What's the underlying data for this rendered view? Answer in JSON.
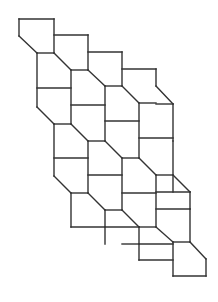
{
  "diagram": {
    "stroke_color": "#333333",
    "background": "#ffffff",
    "segments": [
      [
        19,
        19,
        54,
        19
      ],
      [
        19,
        19,
        19,
        36
      ],
      [
        19,
        36,
        37,
        53
      ],
      [
        54,
        19,
        54,
        53
      ],
      [
        37,
        53,
        54,
        53
      ],
      [
        54,
        35,
        88,
        35
      ],
      [
        88,
        35,
        88,
        70
      ],
      [
        54,
        53,
        71,
        70
      ],
      [
        71,
        70,
        88,
        70
      ],
      [
        88,
        52,
        122,
        52
      ],
      [
        122,
        52,
        122,
        86
      ],
      [
        88,
        70,
        105,
        86
      ],
      [
        105,
        86,
        122,
        86
      ],
      [
        122,
        69,
        156,
        69
      ],
      [
        156,
        69,
        156,
        86
      ],
      [
        156,
        86,
        173,
        104
      ],
      [
        37,
        53,
        37,
        107
      ],
      [
        37,
        88,
        71,
        88
      ],
      [
        71,
        70,
        71,
        124
      ],
      [
        71,
        105,
        105,
        105
      ],
      [
        105,
        86,
        105,
        141
      ],
      [
        105,
        121,
        139,
        121
      ],
      [
        122,
        86,
        139,
        103
      ],
      [
        139,
        103,
        156,
        103
      ],
      [
        139,
        103,
        139,
        158
      ],
      [
        156,
        104,
        173,
        104
      ],
      [
        173,
        104,
        173,
        141
      ],
      [
        139,
        138,
        173,
        138
      ],
      [
        37,
        107,
        54,
        124
      ],
      [
        54,
        124,
        71,
        124
      ],
      [
        54,
        124,
        54,
        176
      ],
      [
        54,
        158,
        88,
        158
      ],
      [
        71,
        124,
        88,
        141
      ],
      [
        88,
        141,
        105,
        141
      ],
      [
        88,
        141,
        88,
        193
      ],
      [
        88,
        175,
        122,
        175
      ],
      [
        105,
        141,
        122,
        158
      ],
      [
        122,
        158,
        139,
        158
      ],
      [
        122,
        158,
        122,
        210
      ],
      [
        122,
        193,
        156,
        193
      ],
      [
        139,
        158,
        156,
        175
      ],
      [
        156,
        175,
        173,
        175
      ],
      [
        156,
        175,
        156,
        227
      ],
      [
        173,
        141,
        173,
        192
      ],
      [
        156,
        192,
        190,
        192
      ],
      [
        173,
        175,
        190,
        192
      ],
      [
        190,
        192,
        190,
        209
      ],
      [
        54,
        176,
        71,
        193
      ],
      [
        71,
        193,
        88,
        193
      ],
      [
        71,
        193,
        71,
        227
      ],
      [
        71,
        227,
        105,
        227
      ],
      [
        88,
        193,
        105,
        210
      ],
      [
        105,
        210,
        122,
        210
      ],
      [
        105,
        210,
        105,
        244
      ],
      [
        105,
        227,
        139,
        227
      ],
      [
        122,
        210,
        139,
        227
      ],
      [
        139,
        227,
        156,
        227
      ],
      [
        139,
        227,
        139,
        260
      ],
      [
        139,
        244,
        173,
        244
      ],
      [
        156,
        227,
        173,
        242
      ],
      [
        173,
        242,
        190,
        242
      ],
      [
        173,
        242,
        173,
        276
      ],
      [
        173,
        260,
        139,
        260
      ],
      [
        190,
        209,
        190,
        242
      ],
      [
        190,
        242,
        206,
        259
      ],
      [
        206,
        259,
        206,
        276
      ],
      [
        173,
        276,
        206,
        276
      ],
      [
        156,
        209,
        190,
        209
      ],
      [
        122,
        244,
        139,
        244
      ]
    ]
  }
}
